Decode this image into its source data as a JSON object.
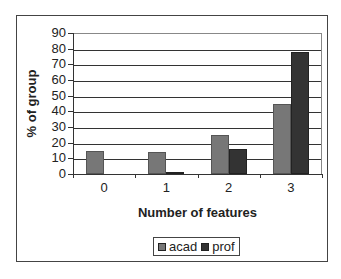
{
  "chart_data": {
    "type": "bar",
    "title": "",
    "xlabel": "Number of features",
    "ylabel": "% of group",
    "categories": [
      "0",
      "1",
      "2",
      "3"
    ],
    "series": [
      {
        "name": "acad",
        "values": [
          15,
          14,
          25,
          45
        ],
        "color": "#777777"
      },
      {
        "name": "prof",
        "values": [
          0,
          1,
          16,
          78
        ],
        "color": "#333333"
      }
    ],
    "ylim": [
      0,
      90
    ],
    "yticks": [
      0,
      10,
      20,
      30,
      40,
      50,
      60,
      70,
      80,
      90
    ],
    "grid": true,
    "legend_position": "bottom"
  },
  "legend": {
    "items": [
      {
        "label": "acad",
        "color": "#777777"
      },
      {
        "label": "prof",
        "color": "#333333"
      }
    ]
  }
}
